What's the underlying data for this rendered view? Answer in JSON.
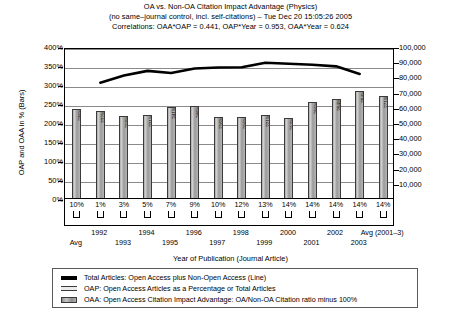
{
  "title": {
    "line1": "OA vs. Non-OA Citation Impact Advantage (Physics)",
    "line2": "(no same–journal control, incl. self-citations) –  Tue Dec 20 15:05:26 2005",
    "line3": "Correlations: OAA*OAP = 0.441, OAP*Year = 0.953, OAA*Year = 0.624"
  },
  "axes": {
    "ylabel_left": "OAP and OAA in % (Bars)",
    "ylabel_right": "Total Open plus Non-Open Access Articles (Line)",
    "xlabel": "Year of Publication (Journal Article)",
    "yticks_left": [
      "400%",
      "350%",
      "300%",
      "250%",
      "200%",
      "150%",
      "100%",
      "50%",
      "0%"
    ],
    "yticks_right": [
      "100,000",
      "90,000",
      "80,000",
      "70,000",
      "60,000",
      "50,000",
      "40,000",
      "30,000",
      "20,000",
      "10,000"
    ]
  },
  "legend": {
    "items": [
      {
        "swatch": "line",
        "label": "Total Articles: Open Access plus Non-Open Access (Line)"
      },
      {
        "swatch": "oap",
        "label": "OAP: Open Access Articles as a Percentage or Total Articles"
      },
      {
        "swatch": "oaa",
        "label": "OAA: Open Access Citation Impact Advantage: OA/Non-OA Citation ratio minus 100%"
      }
    ]
  },
  "chart_data": {
    "type": "bar",
    "title": "OA vs. Non-OA Citation Impact Advantage (Physics)",
    "xlabel": "Year of Publication (Journal Article)",
    "ylabel": "OAP and OAA in % (Bars)",
    "ylabel2": "Total Open plus Non-Open Access Articles (Line)",
    "ylim": [
      0,
      400
    ],
    "ylim2": [
      0,
      100000
    ],
    "grid": true,
    "legend_position": "bottom",
    "categories": [
      "Avg",
      "1992",
      "1993",
      "1994",
      "1995",
      "1996",
      "1997",
      "1998",
      "1999",
      "2000",
      "2001",
      "2002",
      "2003",
      "Avg (2001–3)"
    ],
    "category_rows": [
      {
        "label": "Avg",
        "row": 2
      },
      {
        "label": "1992",
        "row": 1
      },
      {
        "label": "1993",
        "row": 2
      },
      {
        "label": "1994",
        "row": 1
      },
      {
        "label": "1995",
        "row": 2
      },
      {
        "label": "1996",
        "row": 1
      },
      {
        "label": "1997",
        "row": 2
      },
      {
        "label": "1998",
        "row": 1
      },
      {
        "label": "1999",
        "row": 2
      },
      {
        "label": "2000",
        "row": 1
      },
      {
        "label": "2001",
        "row": 2
      },
      {
        "label": "2002",
        "row": 1
      },
      {
        "label": "2003",
        "row": 2
      },
      {
        "label": "Avg (2001–3)",
        "row": 1
      }
    ],
    "series": [
      {
        "name": "OAA: Open Access Citation Impact Advantage: OA/Non-OA Citation ratio minus 100%",
        "type": "bar",
        "axis": "left",
        "unit": "%",
        "values": [
          236,
          232,
          218,
          221,
          241,
          246,
          216,
          216,
          221,
          213,
          256,
          264,
          284,
          271
        ]
      },
      {
        "name": "OAP: Open Access Articles as a Percentage or Total Articles",
        "type": "bar-label",
        "axis": "left",
        "unit": "%",
        "values": [
          10,
          1,
          3,
          5,
          7,
          9,
          10,
          12,
          13,
          14,
          14,
          14,
          14,
          14
        ],
        "labels": [
          "10%",
          "1%",
          "3%",
          "5%",
          "7%",
          "9%",
          "10%",
          "12%",
          "13%",
          "14%",
          "14%",
          "14%",
          "14%",
          "14%"
        ]
      },
      {
        "name": "Total Articles: Open Access plus Non-Open Access (Line)",
        "type": "line",
        "axis": "right",
        "values": [
          null,
          77800,
          82500,
          85600,
          84200,
          87200,
          87800,
          88000,
          91000,
          90300,
          89600,
          88600,
          83600,
          null
        ]
      }
    ]
  }
}
